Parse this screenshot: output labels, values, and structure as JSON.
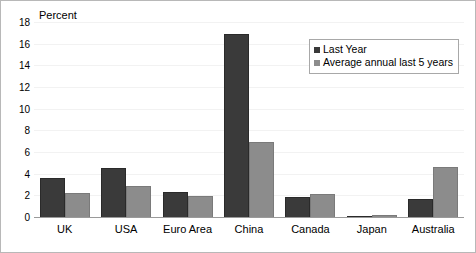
{
  "chart_data": {
    "type": "bar",
    "title": "",
    "ylabel": "Percent",
    "xlabel": "",
    "ylim": [
      0,
      18
    ],
    "yticks": [
      0,
      2,
      4,
      6,
      8,
      10,
      12,
      14,
      16,
      18
    ],
    "grid": true,
    "legend_position": "top-right",
    "categories": [
      "UK",
      "USA",
      "Euro Area",
      "China",
      "Canada",
      "Japan",
      "Australia"
    ],
    "series": [
      {
        "name": "Last Year",
        "color": "#3a3a3a",
        "values": [
          3.7,
          4.6,
          2.4,
          17.0,
          1.9,
          0.1,
          1.8
        ]
      },
      {
        "name": "Average annual last 5 years",
        "color": "#8c8c8c",
        "values": [
          2.3,
          3.0,
          2.0,
          7.0,
          2.2,
          0.3,
          4.7
        ]
      }
    ]
  },
  "legend": {
    "entries": [
      {
        "label": "Last Year"
      },
      {
        "label": "Average annual last 5 years"
      }
    ]
  }
}
